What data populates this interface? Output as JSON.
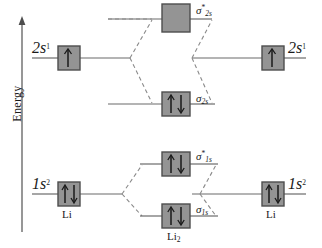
{
  "figure": {
    "type": "molecular-orbital-energy-diagram",
    "molecule": "Li2",
    "axis": {
      "label": "Energy",
      "direction": "up",
      "ticks_shown": false
    },
    "left_atom": {
      "name": "Li",
      "orbitals": [
        {
          "id": "left-2s",
          "label": "2s",
          "superscript": "1",
          "electrons": 1,
          "arrows": "up",
          "energy_level": "upper"
        },
        {
          "id": "left-1s",
          "label": "1s",
          "superscript": "2",
          "electrons": 2,
          "arrows": "up-down",
          "energy_level": "lower"
        }
      ]
    },
    "right_atom": {
      "name": "Li",
      "orbitals": [
        {
          "id": "right-2s",
          "label": "2s",
          "superscript": "1",
          "electrons": 1,
          "arrows": "up",
          "energy_level": "upper"
        },
        {
          "id": "right-1s",
          "label": "1s",
          "superscript": "2",
          "electrons": 2,
          "arrows": "up-down",
          "energy_level": "lower"
        }
      ]
    },
    "molecular_orbitals": [
      {
        "id": "sigma-2s-star",
        "symbol": "σ",
        "star": true,
        "subscript": "2s",
        "electrons": 0,
        "arrows": "none",
        "type": "antibonding"
      },
      {
        "id": "sigma-2s",
        "symbol": "σ",
        "star": false,
        "subscript": "2s",
        "electrons": 2,
        "arrows": "up-down",
        "type": "bonding"
      },
      {
        "id": "sigma-1s-star",
        "symbol": "σ",
        "star": true,
        "subscript": "1s",
        "electrons": 2,
        "arrows": "up-down",
        "type": "antibonding"
      },
      {
        "id": "sigma-1s",
        "symbol": "σ",
        "star": false,
        "subscript": "1s",
        "electrons": 2,
        "arrows": "up-down",
        "type": "bonding"
      }
    ],
    "center_label": "Li",
    "center_label_subscript": "2",
    "colors": {
      "box_fill": "#949494",
      "box_border": "#4d4d4d",
      "line": "#6b6b6b",
      "dashed_line": "#8a8a8a",
      "arrow": "#1a1a1a",
      "text": "#1a1a1a",
      "background": "#ffffff"
    }
  },
  "labels": {
    "energy": "Energy",
    "left_2s_base": "2s",
    "left_2s_sup": "1",
    "left_1s_base": "1s",
    "left_1s_sup": "2",
    "right_2s_base": "2s",
    "right_2s_sup": "1",
    "right_1s_base": "1s",
    "right_1s_sup": "2",
    "sigma": "σ",
    "star": "*",
    "sub_2s": "2s",
    "sub_1s": "1s",
    "atom_left": "Li",
    "atom_right": "Li",
    "molecule_base": "Li",
    "molecule_sub": "2"
  }
}
